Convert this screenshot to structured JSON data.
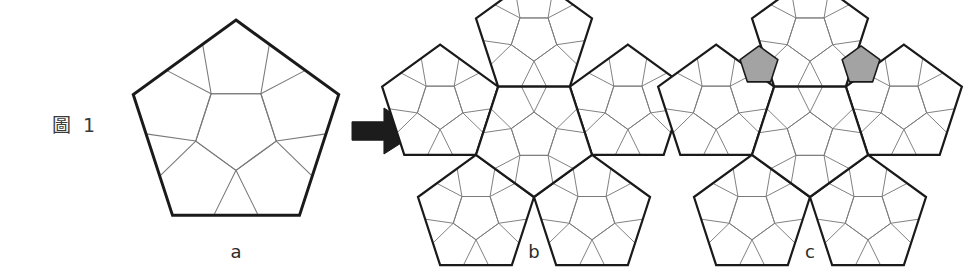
{
  "figure": {
    "label": "圖 1",
    "label_icon": "figure-number-label",
    "background_color": "#ffffff",
    "width": 978,
    "height": 280
  },
  "panels": [
    {
      "id": "a",
      "caption": "a",
      "name": "panel-a-single-subdivided-pentagon",
      "description": "One pentagon subdivided into six smaller pentagons",
      "outline_color": "#1a1a1a",
      "inner_line_color": "#7a7a7a",
      "fill_color": "#ffffff",
      "center": [
        236,
        128
      ],
      "radius": 108,
      "rotation": 0,
      "tiles": 6,
      "shaded_tiles": 0
    },
    {
      "id": "b",
      "caption": "b",
      "name": "panel-b-pentagon-rosette",
      "description": "Five subdivided pentagons arranged around a central subdivided pentagon",
      "outline_color": "#1a1a1a",
      "inner_line_color": "#7a7a7a",
      "fill_color": "#ffffff",
      "center": [
        534,
        136
      ],
      "radius": 61,
      "rotation": 180,
      "tiles": 6,
      "shaded_tiles": 0
    },
    {
      "id": "c",
      "caption": "c",
      "name": "panel-c-pentagon-rosette-with-gaps-filled",
      "description": "Same rosette as b with two gray pentagons filling the upper gaps",
      "outline_color": "#1a1a1a",
      "inner_line_color": "#7a7a7a",
      "fill_color": "#ffffff",
      "gap_fill_color": "#a3a3a3",
      "gap_stroke_color": "#1a1a1a",
      "center": [
        810,
        136
      ],
      "radius": 61,
      "rotation": 180,
      "tiles": 6,
      "shaded_tiles": 2
    }
  ],
  "arrow": {
    "name": "transform-arrow",
    "direction": "right",
    "color": "#1c1c1c",
    "x": 352,
    "y": 108,
    "width": 68,
    "height": 46
  },
  "colors": {
    "outline": "#1a1a1a",
    "inner_line": "#7a7a7a",
    "shade": "#a3a3a3",
    "text": "#2b2b2b",
    "background": "#ffffff"
  }
}
